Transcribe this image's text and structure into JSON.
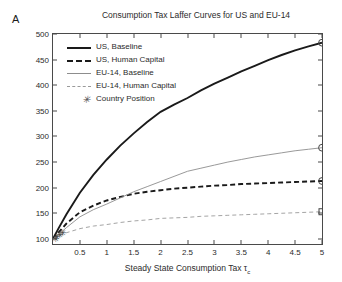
{
  "panel": {
    "label": "A"
  },
  "chart_data": {
    "type": "line",
    "title": "Consumption Tax Laffer Curves for US and EU-14",
    "xlabel": "Steady State Consumption Tax τ",
    "xlabel_subscript": "c",
    "ylabel": "Steady State Tax Revenues (Average=100)",
    "xlim": [
      0,
      5
    ],
    "ylim": [
      90,
      500
    ],
    "xticks": [
      "0.5",
      "1",
      "1.5",
      "2",
      "2.5",
      "3",
      "3.5",
      "4",
      "4.5",
      "5"
    ],
    "xtick_values": [
      0.5,
      1,
      1.5,
      2,
      2.5,
      3,
      3.5,
      4,
      4.5,
      5
    ],
    "yticks": [
      "100",
      "150",
      "200",
      "250",
      "300",
      "350",
      "400",
      "450",
      "500"
    ],
    "ytick_values": [
      100,
      150,
      200,
      250,
      300,
      350,
      400,
      450,
      500
    ],
    "grid": false,
    "legend_position": "upper left",
    "x": [
      0,
      0.1,
      0.25,
      0.5,
      0.75,
      1,
      1.25,
      1.5,
      1.75,
      2,
      2.25,
      2.5,
      2.75,
      3,
      3.25,
      3.5,
      3.75,
      4,
      4.25,
      4.5,
      4.75,
      5
    ],
    "series": [
      {
        "name": "US, Baseline",
        "style": "solid",
        "width": "thick",
        "color": "#1a1a1a",
        "end_marker": "circle",
        "end_value": 483,
        "values": [
          100,
          120,
          148,
          190,
          225,
          255,
          282,
          306,
          328,
          348,
          362,
          375,
          390,
          403,
          415,
          427,
          438,
          449,
          459,
          468,
          476,
          483
        ]
      },
      {
        "name": "US, Human Capital",
        "style": "dashed",
        "width": "thick",
        "color": "#1a1a1a",
        "end_marker": "circle",
        "end_value": 213,
        "values": [
          100,
          112,
          130,
          152,
          165,
          175,
          182,
          188,
          192,
          195,
          198,
          200,
          202,
          204,
          205,
          207,
          208,
          209,
          210,
          211,
          212,
          213
        ]
      },
      {
        "name": "EU-14, Baseline",
        "style": "solid",
        "width": "thin",
        "color": "#8d8d8d",
        "end_marker": "circle",
        "end_value": 278,
        "values": [
          100,
          108,
          122,
          143,
          157,
          168,
          180,
          192,
          202,
          212,
          222,
          232,
          238,
          244,
          250,
          255,
          260,
          264,
          268,
          272,
          275,
          278
        ]
      },
      {
        "name": "EU-14, Human Capital",
        "style": "dashed",
        "width": "thin",
        "color": "#9a9a9a",
        "end_marker": "square",
        "end_value": 153,
        "values": [
          100,
          105,
          112,
          120,
          125,
          128,
          132,
          135,
          137,
          140,
          141,
          142,
          144,
          145,
          146,
          147,
          148,
          149,
          150,
          151,
          152,
          153
        ]
      }
    ],
    "country_positions": {
      "name": "Country Position",
      "marker": "star",
      "points": [
        {
          "x": 0.05,
          "y": 100
        },
        {
          "x": 0.08,
          "y": 103
        },
        {
          "x": 0.13,
          "y": 107
        },
        {
          "x": 0.18,
          "y": 112
        }
      ]
    },
    "legend": [
      {
        "label": "US, Baseline",
        "sample": "solid-thick"
      },
      {
        "label": "US, Human Capital",
        "sample": "dash-thick"
      },
      {
        "label": "EU-14, Baseline",
        "sample": "solid-thin"
      },
      {
        "label": "EU-14, Human Capital",
        "sample": "dash-thin"
      },
      {
        "label": "Country Position",
        "sample": "star"
      }
    ]
  }
}
